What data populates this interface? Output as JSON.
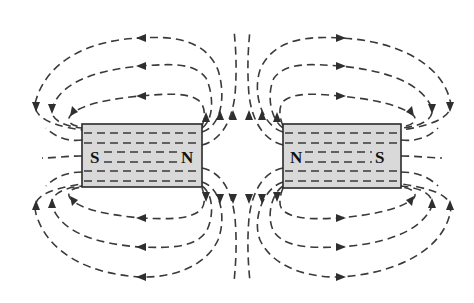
{
  "diagram": {
    "title": "",
    "colors": {
      "magnet_fill": "#d9d9d9",
      "line": "#3a3a3a",
      "background": "#ffffff"
    },
    "magnets": [
      {
        "id": "left",
        "left_pole": "S",
        "right_pole": "N"
      },
      {
        "id": "right",
        "left_pole": "N",
        "right_pole": "S"
      }
    ],
    "field_line_direction": "exits N pole, enters S pole; lines repel in the gap between the N poles"
  }
}
